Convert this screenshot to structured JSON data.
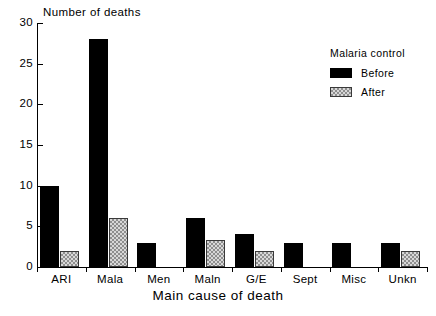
{
  "chart_data": {
    "type": "bar",
    "title": "",
    "xlabel": "Main cause of death",
    "ylabel": "Number of deaths",
    "categories": [
      "ARI",
      "Mala",
      "Men",
      "Maln",
      "G/E",
      "Sept",
      "Misc",
      "Unkn"
    ],
    "series": [
      {
        "name": "Before",
        "color": "#000000",
        "values": [
          10,
          28,
          3,
          6,
          4,
          3,
          3,
          3
        ]
      },
      {
        "name": "After",
        "color": "#d8d8d8",
        "values": [
          2,
          6,
          0,
          3.3,
          2,
          0,
          0,
          2
        ]
      }
    ],
    "ylim": [
      0,
      30
    ],
    "yticks": [
      0,
      5,
      10,
      15,
      20,
      25,
      30
    ],
    "ytick_labels": [
      "0",
      "5",
      "10",
      "15",
      "20",
      "25",
      "30"
    ],
    "grid": false,
    "legend": {
      "title": "Malaria control",
      "position": "top-right",
      "entries": [
        "Before",
        "After"
      ]
    }
  }
}
